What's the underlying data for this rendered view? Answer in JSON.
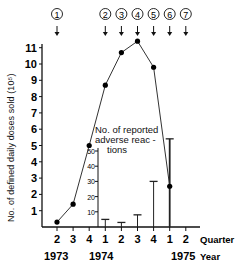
{
  "chart_data": {
    "type": "line",
    "title": "",
    "xlabel": "Quarter / Year",
    "ylabel": "No. of defined daily doses sold (10^5)",
    "y2label": "No. of reported adverse reactions",
    "categories": [
      "1973 Q2",
      "1973 Q3",
      "1973 Q4",
      "1974 Q1",
      "1974 Q2",
      "1974 Q3",
      "1974 Q4",
      "1975 Q1",
      "1975 Q2"
    ],
    "quarter_ticks": [
      "2",
      "3",
      "4",
      "1",
      "2",
      "3",
      "4",
      "1",
      "2"
    ],
    "year_ticks": [
      "1973",
      "1974",
      "1975"
    ],
    "quarter_axis_label": "Quarter",
    "year_axis_label": "Year",
    "ylim": [
      0,
      11
    ],
    "yticks": [
      1,
      2,
      3,
      4,
      5,
      6,
      7,
      8,
      9,
      10,
      11
    ],
    "y2lim": [
      0,
      50
    ],
    "y2ticks": [
      10,
      20,
      30,
      40,
      50
    ],
    "series": [
      {
        "name": "Defined daily doses sold (10^5)",
        "type": "line",
        "axis": "left",
        "values": [
          0.3,
          1.4,
          5.0,
          8.7,
          10.7,
          11.4,
          9.8,
          2.5,
          null
        ]
      },
      {
        "name": "No. of reported adverse reactions",
        "type": "bar",
        "axis": "right",
        "values": [
          null,
          null,
          null,
          5,
          3,
          8,
          30,
          58,
          null
        ]
      }
    ],
    "event_markers": [
      {
        "label": "①",
        "category": "1973 Q2"
      },
      {
        "label": "②",
        "category": "1974 Q1"
      },
      {
        "label": "③",
        "category": "1974 Q2"
      },
      {
        "label": "④",
        "category": "1974 Q3"
      },
      {
        "label": "⑤",
        "category": "1974 Q4"
      },
      {
        "label": "⑥",
        "category": "1975 Q1"
      },
      {
        "label": "⑦",
        "category": "1975 Q2"
      }
    ],
    "grid": false,
    "legend": "inline annotation"
  },
  "labels": {
    "ylabel": "No. of defined daily doses sold (10⁵)",
    "y2label_line1": "No. of reported",
    "y2label_line2": "adverse reac -",
    "y2label_line3": "tions",
    "quarter": "Quarter",
    "year": "Year"
  }
}
